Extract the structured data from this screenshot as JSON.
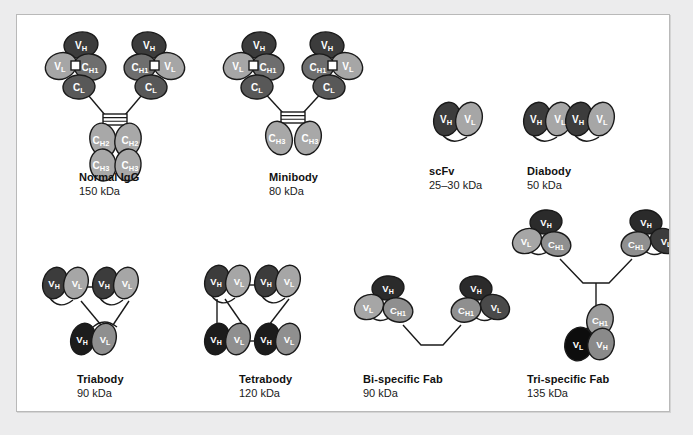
{
  "figure": {
    "background_color": "#ececed",
    "panel_color": "#ffffff",
    "panel_border_color": "#b9b9b9"
  },
  "palette": {
    "vh_dark": "#3c3c3c",
    "vh_black": "#111111",
    "vl_light": "#a6a6a6",
    "vl_black": "#0d0d0d",
    "ch1_mid": "#6e6e6e",
    "cl_mid": "#6e6e6e",
    "ch1_light": "#9c9c9c",
    "fc_gray": "#a8a8a8",
    "vh_mid": "#8a8a8a",
    "outline": "#1a1a1a",
    "linker": "#1a1a1a",
    "connector_square": "#ffffff",
    "label_text": "#ffffff"
  },
  "domain_labels": {
    "vh": "V",
    "vh_sub": "H",
    "vl": "V",
    "vl_sub": "L",
    "ch1": "C",
    "ch1_sub": "H1",
    "cl": "C",
    "cl_sub": "L",
    "ch2": "C",
    "ch2_sub": "H2",
    "ch3": "C",
    "ch3_sub": "H3"
  },
  "constructs": [
    {
      "id": "normal-igg",
      "name": "Normal IgG",
      "mass": "150 kDa",
      "row": 1,
      "column": 1,
      "domains": [
        "VH",
        "VL",
        "CH1",
        "CL",
        "CH2",
        "CH3"
      ],
      "arms": 2,
      "has_fc": true,
      "has_hinge": true
    },
    {
      "id": "minibody",
      "name": "Minibody",
      "mass": "80 kDa",
      "row": 1,
      "column": 2,
      "domains": [
        "VH",
        "VL",
        "CH1",
        "CL",
        "CH3"
      ],
      "arms": 2,
      "has_fc": false,
      "has_hinge": true
    },
    {
      "id": "scfv",
      "name": "scFv",
      "mass": "25–30 kDa",
      "row": 1,
      "column": 3,
      "domains": [
        "VH",
        "VL"
      ],
      "arms": 1,
      "has_fc": false,
      "has_hinge": false
    },
    {
      "id": "diabody",
      "name": "Diabody",
      "mass": "50 kDa",
      "row": 1,
      "column": 4,
      "domains": [
        "VH",
        "VL",
        "VH",
        "VL"
      ],
      "arms": 2,
      "has_fc": false,
      "has_hinge": false
    },
    {
      "id": "triabody",
      "name": "Triabody",
      "mass": "90 kDa",
      "row": 2,
      "column": 1,
      "domains": [
        "VH",
        "VL",
        "VH",
        "VL",
        "VH",
        "VL"
      ],
      "arms": 3,
      "has_fc": false,
      "has_hinge": false
    },
    {
      "id": "tetrabody",
      "name": "Tetrabody",
      "mass": "120 kDa",
      "row": 2,
      "column": 2,
      "domains": [
        "VH",
        "VL",
        "VH",
        "VL",
        "VH",
        "VL",
        "VH",
        "VL"
      ],
      "arms": 4,
      "has_fc": false,
      "has_hinge": false
    },
    {
      "id": "bi-specific-fab",
      "name": "Bi-specific Fab",
      "mass": "90 kDa",
      "row": 2,
      "column": 3,
      "domains": [
        "VH",
        "VL",
        "CH1",
        "VH",
        "VL",
        "CH1"
      ],
      "arms": 2,
      "has_fc": false,
      "has_hinge": false
    },
    {
      "id": "tri-specific-fab",
      "name": "Tri-specific Fab",
      "mass": "135 kDa",
      "row": 2,
      "column": 4,
      "domains": [
        "VH",
        "VL",
        "CH1",
        "VH",
        "VL",
        "CH1",
        "VH",
        "VL",
        "CH1"
      ],
      "arms": 3,
      "has_fc": false,
      "has_hinge": false
    }
  ]
}
